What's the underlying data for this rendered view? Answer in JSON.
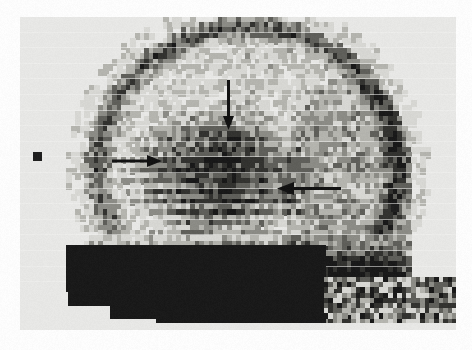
{
  "figure": {
    "modality": "pixelated raster scintigram",
    "view": "lateral",
    "background_color": "#ffffff",
    "frame": {
      "x": 20,
      "y": 17,
      "width": 436,
      "height": 313,
      "paper_color": "#e9e9e7",
      "ink_color": "#141414"
    }
  },
  "scan": {
    "cell_width": 4.6,
    "cell_height": 5.2,
    "row_gap_color": "#f2f2f0",
    "levels": [
      "#f2f2f0",
      "#d8d8d4",
      "#b4b4ae",
      "#8a8a84",
      "#5c5c57",
      "#2e2e2b",
      "#141414"
    ],
    "head": {
      "center_x": 228,
      "center_y": 150,
      "radius_x": 162,
      "radius_y": 150,
      "flat_base_y": 300
    },
    "lesion": {
      "label": "photopenic / hot region",
      "center_x": 196,
      "center_y": 158,
      "radius_x": 78,
      "radius_y": 62
    },
    "base_band": {
      "label": "dense skull base band",
      "top_y": 215,
      "bottom_y": 300
    },
    "staircase_steps": [
      {
        "x": 48,
        "y": 275,
        "width": 388,
        "height": 14
      },
      {
        "x": 90,
        "y": 289,
        "width": 346,
        "height": 13
      },
      {
        "x": 136,
        "y": 302,
        "width": 300,
        "height": 11
      }
    ]
  },
  "annotations": {
    "arrow_color": "#0d0d0d",
    "arrows": [
      {
        "name": "arrow-down-superior",
        "direction": "down",
        "label": "superior region marker",
        "x": 228,
        "y": 80,
        "length": 36,
        "thickness": 3,
        "head_length": 14,
        "head_width": 11
      },
      {
        "name": "arrow-right-anterior",
        "direction": "right",
        "label": "anterior region marker",
        "x": 112,
        "y": 161,
        "length": 35,
        "thickness": 3,
        "head_length": 15,
        "head_width": 12
      },
      {
        "name": "arrow-left-posterior",
        "direction": "left",
        "label": "posterior region marker",
        "x": 341,
        "y": 188,
        "length": 45,
        "thickness": 3,
        "head_length": 17,
        "head_width": 13
      }
    ],
    "fiducial_markers": [
      {
        "name": "fiducial-marker-left",
        "x": 33,
        "y": 152,
        "size": 9,
        "color": "#1a1a1a"
      },
      {
        "name": "fiducial-marker-right",
        "x": 391,
        "y": 204,
        "size": 8,
        "color": "#1a1a1a"
      }
    ]
  }
}
